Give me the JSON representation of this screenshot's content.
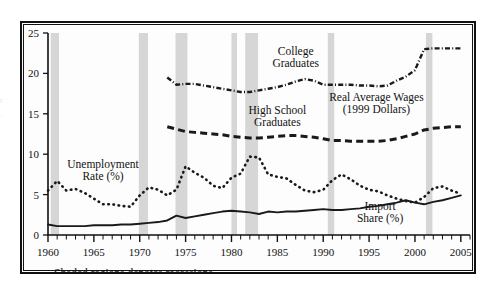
{
  "figure": {
    "caption": "Shaded regions denotes recessions.",
    "frame_color": "#111111",
    "background": "#ffffff",
    "band_color": "#d6d6d6"
  },
  "chart_data": {
    "type": "line",
    "title": "",
    "subtitle": "",
    "xlabel": "",
    "ylabel": "",
    "xlim": [
      1960,
      2006
    ],
    "ylim": [
      0,
      25
    ],
    "yticks": [
      0,
      5,
      10,
      15,
      20,
      25
    ],
    "ytick_labels": [
      "0",
      "5",
      "10",
      "15",
      "20",
      "25"
    ],
    "xticks_labeled": [
      1960,
      1965,
      1970,
      1975,
      1980,
      1985,
      1990,
      1995,
      2000,
      2005
    ],
    "xtick_labels": [
      "1960",
      "1965",
      "1970",
      "1975",
      "1980",
      "1985",
      "1990",
      "1995",
      "2000",
      "2005"
    ],
    "xtick_minor_step": 1,
    "grid": false,
    "legend_position": "inline-annotations",
    "annotations": [
      {
        "name": "unemployment-rate-label",
        "text": "Unemployment\nRate (%)",
        "lines": [
          "Unemployment",
          "Rate (%)"
        ],
        "x": 1966.0,
        "y": 8.3
      },
      {
        "name": "college-graduates-label",
        "text": "College\nGraduates",
        "lines": [
          "College",
          "Graduates"
        ],
        "x": 1987.0,
        "y": 22.3
      },
      {
        "name": "high-school-graduates-label",
        "text": "High School\nGraduates",
        "lines": [
          "High School",
          "Graduates"
        ],
        "x": 1985.0,
        "y": 15.0
      },
      {
        "name": "real-average-wages-label",
        "text": "Real Average Wages\n(1999 Dollars)",
        "lines": [
          "Real Average Wages",
          "(1999 Dollars)"
        ],
        "x": 1995.8,
        "y": 16.6
      },
      {
        "name": "import-share-label",
        "text": "Import\nShare (%)",
        "lines": [
          "Import",
          "Share (%)"
        ],
        "x": 1996.2,
        "y": 3.1
      }
    ],
    "recessions": [
      {
        "name": "recession-1960-1961",
        "start": 1960.3,
        "end": 1961.2
      },
      {
        "name": "recession-1969-1970",
        "start": 1969.9,
        "end": 1970.9
      },
      {
        "name": "recession-1973-1975",
        "start": 1973.9,
        "end": 1975.2
      },
      {
        "name": "recession-1980",
        "start": 1980.0,
        "end": 1980.6
      },
      {
        "name": "recession-1981-1982",
        "start": 1981.5,
        "end": 1982.9
      },
      {
        "name": "recession-1990-1991",
        "start": 1990.5,
        "end": 1991.2
      },
      {
        "name": "recession-2001",
        "start": 2001.2,
        "end": 2001.9
      }
    ],
    "series": [
      {
        "name": "Unemployment Rate (%)",
        "key": "unemployment-rate",
        "style": "dotted",
        "color": "#1a1a1a",
        "x": [
          1960,
          1961,
          1962,
          1963,
          1964,
          1965,
          1966,
          1967,
          1968,
          1969,
          1970,
          1971,
          1972,
          1973,
          1974,
          1975,
          1976,
          1977,
          1978,
          1979,
          1980,
          1981,
          1982,
          1983,
          1984,
          1985,
          1986,
          1987,
          1988,
          1989,
          1990,
          1991,
          1992,
          1993,
          1994,
          1995,
          1996,
          1997,
          1998,
          1999,
          2000,
          2001,
          2002,
          2003,
          2004,
          2005
        ],
        "values": [
          5.5,
          6.7,
          5.5,
          5.7,
          5.2,
          4.5,
          3.8,
          3.8,
          3.6,
          3.5,
          4.9,
          5.9,
          5.6,
          4.9,
          5.6,
          8.5,
          7.7,
          7.1,
          6.1,
          5.8,
          7.1,
          7.6,
          9.7,
          9.6,
          7.5,
          7.2,
          7.0,
          6.2,
          5.5,
          5.3,
          5.6,
          6.8,
          7.5,
          6.9,
          6.1,
          5.6,
          5.4,
          4.9,
          4.5,
          4.2,
          4.0,
          4.7,
          5.8,
          6.0,
          5.5,
          5.1
        ]
      },
      {
        "name": "College Graduates",
        "key": "college-graduates",
        "style": "dashdot",
        "color": "#1a1a1a",
        "x": [
          1973,
          1974,
          1975,
          1976,
          1977,
          1978,
          1979,
          1980,
          1981,
          1982,
          1983,
          1984,
          1985,
          1986,
          1987,
          1988,
          1989,
          1990,
          1991,
          1992,
          1993,
          1994,
          1995,
          1996,
          1997,
          1998,
          1999,
          2000,
          2001,
          2002,
          2003,
          2004,
          2005
        ],
        "values": [
          19.5,
          18.6,
          18.7,
          18.7,
          18.5,
          18.3,
          18.1,
          17.9,
          17.7,
          17.7,
          17.9,
          18.1,
          18.3,
          18.6,
          19.0,
          19.3,
          19.1,
          18.6,
          18.6,
          18.6,
          18.6,
          18.5,
          18.5,
          18.4,
          18.5,
          19.1,
          19.6,
          20.4,
          23.0,
          23.1,
          23.1,
          23.1,
          23.1
        ]
      },
      {
        "name": "High School Graduates",
        "key": "high-school-graduates",
        "style": "dashed",
        "color": "#1a1a1a",
        "x": [
          1973,
          1974,
          1975,
          1976,
          1977,
          1978,
          1979,
          1980,
          1981,
          1982,
          1983,
          1984,
          1985,
          1986,
          1987,
          1988,
          1989,
          1990,
          1991,
          1992,
          1993,
          1994,
          1995,
          1996,
          1997,
          1998,
          1999,
          2000,
          2001,
          2002,
          2003,
          2004,
          2005
        ],
        "values": [
          13.4,
          13.1,
          12.8,
          12.7,
          12.6,
          12.5,
          12.4,
          12.2,
          12.1,
          12.0,
          12.0,
          12.1,
          12.2,
          12.3,
          12.3,
          12.2,
          12.1,
          11.9,
          11.7,
          11.7,
          11.6,
          11.6,
          11.6,
          11.6,
          11.7,
          11.9,
          12.2,
          12.5,
          13.0,
          13.2,
          13.3,
          13.4,
          13.4
        ]
      },
      {
        "name": "Import Share (%)",
        "key": "import-share",
        "style": "solid",
        "color": "#1a1a1a",
        "x": [
          1960,
          1961,
          1962,
          1963,
          1964,
          1965,
          1966,
          1967,
          1968,
          1969,
          1970,
          1971,
          1972,
          1973,
          1974,
          1975,
          1976,
          1977,
          1978,
          1979,
          1980,
          1981,
          1982,
          1983,
          1984,
          1985,
          1986,
          1987,
          1988,
          1989,
          1990,
          1991,
          1992,
          1993,
          1994,
          1995,
          1996,
          1997,
          1998,
          1999,
          2000,
          2001,
          2002,
          2003,
          2004,
          2005
        ],
        "values": [
          1.3,
          1.1,
          1.1,
          1.1,
          1.1,
          1.2,
          1.2,
          1.2,
          1.3,
          1.3,
          1.4,
          1.5,
          1.6,
          1.8,
          2.4,
          2.1,
          2.3,
          2.5,
          2.7,
          2.9,
          3.0,
          2.9,
          2.8,
          2.6,
          2.9,
          2.8,
          2.9,
          2.9,
          3.0,
          3.1,
          3.2,
          3.1,
          3.1,
          3.2,
          3.3,
          3.5,
          3.6,
          3.8,
          4.0,
          4.3,
          4.0,
          3.8,
          4.1,
          4.3,
          4.6,
          4.9
        ]
      }
    ]
  }
}
